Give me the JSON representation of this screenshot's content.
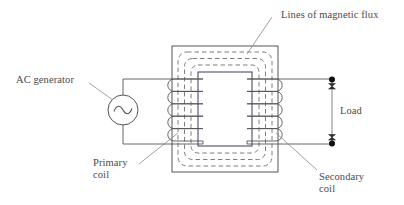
{
  "figure": {
    "kind": "transformer-schematic",
    "title": "",
    "labels": {
      "flux": "Lines of magnetic flux",
      "ac_generator": "AC generator",
      "primary_coil_line1": "Primary",
      "primary_coil_line2": "coil",
      "secondary_coil_line1": "Secondary",
      "secondary_coil_line2": "coil",
      "load": "Load"
    },
    "symbols": {
      "ac_source": "sine-wave",
      "terminal": "filled-dot"
    },
    "colors": {
      "ink": "#4a4a4a",
      "line": "#555555",
      "dashed_flux": "#6b6b6b",
      "core_inner": "#4c4c6a",
      "terminal_fill": "#111111",
      "background": "#ffffff"
    },
    "counts": {
      "primary_turns": 4,
      "secondary_turns": 4,
      "flux_loops": 3
    }
  }
}
